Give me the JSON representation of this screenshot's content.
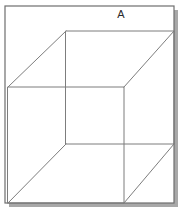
{
  "figure": {
    "label": "A",
    "label_x": 121,
    "label_y": 18,
    "caption_text": "A",
    "colors": {
      "background": "#ffffff",
      "frame_border": "#6e6e6e",
      "frame_shadow": "#a8a8a8",
      "cube_edge": "#7d7d7d",
      "label": "#2b2b2b"
    },
    "frame": {
      "x": 5,
      "y": 6,
      "width": 169,
      "height": 197,
      "shadow_offset": 4
    },
    "back_face": {
      "name": "back-square",
      "points": "66,31 174,31 174,144 66,144"
    },
    "front_face": {
      "name": "front-square",
      "points": "8,87 124,87 124,203 8,203"
    },
    "connectors": [
      {
        "name": "connector-top-left",
        "x1": 8,
        "y1": 87,
        "x2": 66,
        "y2": 31
      },
      {
        "name": "connector-top-right",
        "x1": 124,
        "y1": 87,
        "x2": 174,
        "y2": 31
      },
      {
        "name": "connector-bottom-left",
        "x1": 8,
        "y1": 203,
        "x2": 66,
        "y2": 144
      },
      {
        "name": "connector-bottom-right",
        "x1": 124,
        "y1": 203,
        "x2": 174,
        "y2": 144
      }
    ]
  }
}
